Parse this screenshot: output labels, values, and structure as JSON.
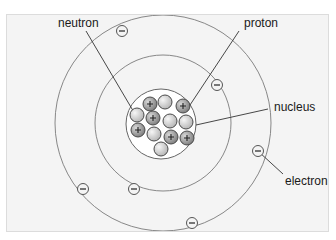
{
  "diagram": {
    "labels": {
      "neutron": "neutron",
      "proton": "proton",
      "nucleus": "nucleus",
      "electron": "electron"
    },
    "electron_symbol": "−",
    "proton_symbol": "+",
    "colors": {
      "panel_bg": "#f4f4f4",
      "orbit": "#7a7a7a",
      "proton_fill": "#9a9a9a",
      "neutron_fill": "#d4d4d4",
      "line": "#333333"
    }
  }
}
